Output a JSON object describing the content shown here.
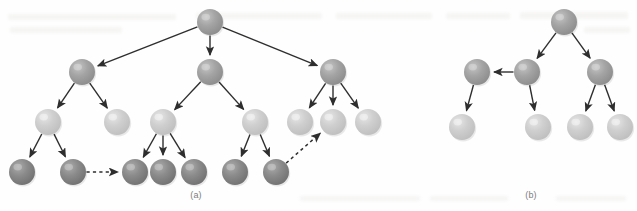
{
  "figure": {
    "background_color": "#fefefe",
    "width": 637,
    "height": 211,
    "palette": {
      "node_medium": "#9a9a9a",
      "node_medium_highlight": "#c4c4c4",
      "node_light": "#c8c8c8",
      "node_light_highlight": "#e6e6e6",
      "node_dark": "#808080",
      "node_dark_highlight": "#ababab",
      "edge_color": "#2e2e2e",
      "caption_color": "#7d7d7d",
      "bleed_color": "#efeeec"
    },
    "node_radius": 13,
    "panels": [
      {
        "id": "panel-a",
        "caption": "(a)",
        "caption_x": 196,
        "caption_y": 195,
        "nodes": [
          {
            "id": "a-root",
            "x": 210,
            "y": 22,
            "shade": "medium",
            "role": "root"
          },
          {
            "id": "a-l1-0",
            "x": 82,
            "y": 72,
            "shade": "medium",
            "role": "internal"
          },
          {
            "id": "a-l1-1",
            "x": 210,
            "y": 72,
            "shade": "medium",
            "role": "internal"
          },
          {
            "id": "a-l1-2",
            "x": 333,
            "y": 72,
            "shade": "medium",
            "role": "internal"
          },
          {
            "id": "a-l2-0",
            "x": 48,
            "y": 122,
            "shade": "light",
            "role": "internal"
          },
          {
            "id": "a-l2-1",
            "x": 117,
            "y": 122,
            "shade": "light",
            "role": "leaf"
          },
          {
            "id": "a-l2-2",
            "x": 163,
            "y": 122,
            "shade": "light",
            "role": "internal"
          },
          {
            "id": "a-l2-3",
            "x": 255,
            "y": 122,
            "shade": "light",
            "role": "internal"
          },
          {
            "id": "a-l2-4",
            "x": 300,
            "y": 122,
            "shade": "light",
            "role": "leaf"
          },
          {
            "id": "a-l2-5",
            "x": 333,
            "y": 122,
            "shade": "light",
            "role": "leaf"
          },
          {
            "id": "a-l2-6",
            "x": 368,
            "y": 122,
            "shade": "light",
            "role": "leaf"
          },
          {
            "id": "a-l3-0",
            "x": 22,
            "y": 172,
            "shade": "dark",
            "role": "leaf"
          },
          {
            "id": "a-l3-1",
            "x": 73,
            "y": 172,
            "shade": "dark",
            "role": "leaf"
          },
          {
            "id": "a-l3-2",
            "x": 135,
            "y": 172,
            "shade": "dark",
            "role": "leaf"
          },
          {
            "id": "a-l3-3",
            "x": 163,
            "y": 172,
            "shade": "dark",
            "role": "leaf"
          },
          {
            "id": "a-l3-4",
            "x": 194,
            "y": 172,
            "shade": "dark",
            "role": "leaf"
          },
          {
            "id": "a-l3-5",
            "x": 235,
            "y": 172,
            "shade": "dark",
            "role": "leaf"
          },
          {
            "id": "a-l3-6",
            "x": 276,
            "y": 172,
            "shade": "dark",
            "role": "leaf"
          }
        ],
        "edges": [
          {
            "from": "a-root",
            "to": "a-l1-0",
            "style": "solid"
          },
          {
            "from": "a-root",
            "to": "a-l1-1",
            "style": "solid"
          },
          {
            "from": "a-root",
            "to": "a-l1-2",
            "style": "solid"
          },
          {
            "from": "a-l1-0",
            "to": "a-l2-0",
            "style": "solid"
          },
          {
            "from": "a-l1-0",
            "to": "a-l2-1",
            "style": "solid"
          },
          {
            "from": "a-l1-1",
            "to": "a-l2-2",
            "style": "solid"
          },
          {
            "from": "a-l1-1",
            "to": "a-l2-3",
            "style": "solid"
          },
          {
            "from": "a-l1-2",
            "to": "a-l2-4",
            "style": "solid"
          },
          {
            "from": "a-l1-2",
            "to": "a-l2-5",
            "style": "solid"
          },
          {
            "from": "a-l1-2",
            "to": "a-l2-6",
            "style": "solid"
          },
          {
            "from": "a-l2-0",
            "to": "a-l3-0",
            "style": "solid"
          },
          {
            "from": "a-l2-0",
            "to": "a-l3-1",
            "style": "solid"
          },
          {
            "from": "a-l2-2",
            "to": "a-l3-2",
            "style": "solid"
          },
          {
            "from": "a-l2-2",
            "to": "a-l3-3",
            "style": "solid"
          },
          {
            "from": "a-l2-2",
            "to": "a-l3-4",
            "style": "solid"
          },
          {
            "from": "a-l2-3",
            "to": "a-l3-5",
            "style": "solid"
          },
          {
            "from": "a-l2-3",
            "to": "a-l3-6",
            "style": "solid"
          },
          {
            "from": "a-l3-1",
            "to": "a-l3-2",
            "style": "dashed"
          },
          {
            "from": "a-l3-6",
            "to": "a-l2-5",
            "style": "dashed"
          }
        ]
      },
      {
        "id": "panel-b",
        "caption": "(b)",
        "caption_x": 531,
        "caption_y": 195,
        "nodes": [
          {
            "id": "b-root",
            "x": 564,
            "y": 22,
            "shade": "medium",
            "role": "root"
          },
          {
            "id": "b-l1-0",
            "x": 527,
            "y": 72,
            "shade": "medium",
            "role": "internal"
          },
          {
            "id": "b-l1-1",
            "x": 600,
            "y": 72,
            "shade": "medium",
            "role": "internal"
          },
          {
            "id": "b-side",
            "x": 477,
            "y": 72,
            "shade": "medium",
            "role": "internal"
          },
          {
            "id": "b-l2-0",
            "x": 462,
            "y": 127,
            "shade": "light",
            "role": "leaf"
          },
          {
            "id": "b-l2-1",
            "x": 538,
            "y": 127,
            "shade": "light",
            "role": "leaf"
          },
          {
            "id": "b-l2-2",
            "x": 580,
            "y": 127,
            "shade": "light",
            "role": "leaf"
          },
          {
            "id": "b-l2-3",
            "x": 620,
            "y": 127,
            "shade": "light",
            "role": "leaf"
          }
        ],
        "edges": [
          {
            "from": "b-root",
            "to": "b-l1-0",
            "style": "solid"
          },
          {
            "from": "b-root",
            "to": "b-l1-1",
            "style": "solid"
          },
          {
            "from": "b-l1-0",
            "to": "b-side",
            "style": "solid"
          },
          {
            "from": "b-side",
            "to": "b-l2-0",
            "style": "solid"
          },
          {
            "from": "b-l1-0",
            "to": "b-l2-1",
            "style": "solid"
          },
          {
            "from": "b-l1-1",
            "to": "b-l2-2",
            "style": "solid"
          },
          {
            "from": "b-l1-1",
            "to": "b-l2-3",
            "style": "solid"
          }
        ]
      }
    ],
    "bleed_marks": [
      {
        "x": 8,
        "y": 14,
        "w": 168,
        "h": 6
      },
      {
        "x": 196,
        "y": 13,
        "w": 126,
        "h": 6
      },
      {
        "x": 336,
        "y": 13,
        "w": 96,
        "h": 6
      },
      {
        "x": 446,
        "y": 13,
        "w": 64,
        "h": 6
      },
      {
        "x": 520,
        "y": 12,
        "w": 108,
        "h": 7
      },
      {
        "x": 10,
        "y": 27,
        "w": 112,
        "h": 6
      },
      {
        "x": 584,
        "y": 27,
        "w": 46,
        "h": 6
      },
      {
        "x": 300,
        "y": 196,
        "w": 120,
        "h": 5
      },
      {
        "x": 430,
        "y": 196,
        "w": 78,
        "h": 5
      },
      {
        "x": 556,
        "y": 196,
        "w": 70,
        "h": 5
      }
    ]
  }
}
